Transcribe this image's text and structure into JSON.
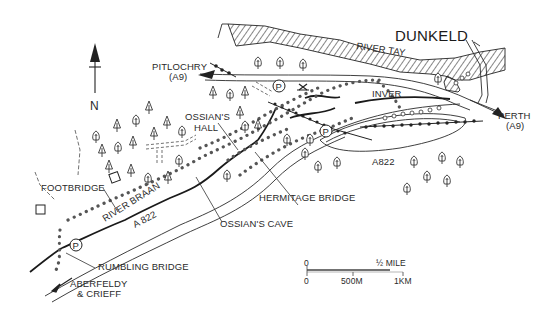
{
  "map": {
    "title": "DUNKELD",
    "compass": {
      "label": "N",
      "icon": "north-arrow-icon"
    },
    "river_labels": {
      "tay": "RIVER TAY",
      "braan": "RIVER BRAAN"
    },
    "places": {
      "dunkeld": "DUNKELD",
      "inver": "INVER",
      "ossians_hall_line1": "OSSIAN'S",
      "ossians_hall_line2": "HALL",
      "footbridge": "FOOTBRIDGE",
      "rumbling_bridge": "RUMBLING BRIDGE",
      "ossians_cave": "OSSIAN'S CAVE",
      "hermitage_bridge": "HERMITAGE BRIDGE"
    },
    "roads": {
      "a822_east": "A822",
      "a822_west": "A 822"
    },
    "destinations": {
      "pitlochry_line1": "PITLOCHRY",
      "pitlochry_line2": "(A9)",
      "perth_line1": "PERTH",
      "perth_line2": "(A9)",
      "aberfeldy_line1": "ABERFELDY",
      "aberfeldy_line2": "& CRIEFF"
    },
    "parking": {
      "symbol": "P",
      "locations": [
        "near Pitlochry road",
        "near Hermitage",
        "Rumbling Bridge"
      ]
    },
    "scale_bar": {
      "miles_start": "0",
      "miles_end": "½ MILE",
      "km_start": "0",
      "km_mid": "500M",
      "km_end": "1KM"
    },
    "legend_icons": [
      "tree-icon",
      "parking-icon",
      "railway-icon",
      "walk-route-dots-icon",
      "viewpoint-cross-icon"
    ]
  }
}
